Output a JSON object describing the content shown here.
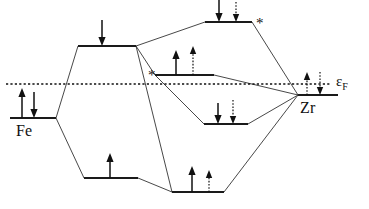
{
  "diagram": {
    "type": "energy-level-correlation",
    "colors": {
      "ink": "#111111",
      "level": "#1a1a1a",
      "correlation": "#333333",
      "background": "#ffffff"
    },
    "fermi": {
      "label_epsilon": "ε",
      "label_subscript": "F",
      "label_full": "εF",
      "y": 84,
      "x_start": 6,
      "x_end": 330,
      "style": "dotted"
    },
    "atoms": [
      {
        "id": "fe",
        "label": "Fe",
        "side": "left"
      },
      {
        "id": "zr",
        "label": "Zr",
        "side": "right"
      }
    ],
    "levels": [
      {
        "id": "fe-atomic",
        "name": "fe-atomic-level",
        "x1": 10,
        "x2": 56,
        "y": 118,
        "electrons": [
          {
            "spin": "up",
            "style": "solid"
          },
          {
            "spin": "down",
            "style": "solid"
          }
        ],
        "star": false
      },
      {
        "id": "top-left-antibonding",
        "name": "upper-left-level",
        "x1": 78,
        "x2": 136,
        "y": 46,
        "electrons": [
          {
            "spin": "down",
            "style": "solid"
          }
        ],
        "star": false
      },
      {
        "id": "top-right-antibonding",
        "name": "upper-right-level",
        "x1": 205,
        "x2": 252,
        "y": 22,
        "electrons": [
          {
            "spin": "down",
            "style": "solid"
          },
          {
            "spin": "down",
            "style": "dotted"
          }
        ],
        "star": true
      },
      {
        "id": "center-level",
        "name": "center-level",
        "x1": 155,
        "x2": 214,
        "y": 75,
        "electrons": [
          {
            "spin": "up",
            "style": "solid"
          },
          {
            "spin": "up",
            "style": "dotted"
          }
        ],
        "star": true
      },
      {
        "id": "mid-right-level",
        "name": "mid-right-level",
        "x1": 204,
        "x2": 248,
        "y": 124,
        "electrons": [
          {
            "spin": "down",
            "style": "solid"
          },
          {
            "spin": "down",
            "style": "dotted"
          }
        ],
        "star": false
      },
      {
        "id": "zr-atomic",
        "name": "zr-atomic-level",
        "x1": 298,
        "x2": 338,
        "y": 95,
        "electrons": [
          {
            "spin": "up",
            "style": "dotted"
          },
          {
            "spin": "down",
            "style": "dotted"
          }
        ],
        "star": false
      },
      {
        "id": "bottom-left-bonding",
        "name": "lower-left-level",
        "x1": 84,
        "x2": 138,
        "y": 178,
        "electrons": [
          {
            "spin": "up",
            "style": "solid"
          }
        ],
        "star": false
      },
      {
        "id": "bottom-right-bonding",
        "name": "lower-right-level",
        "x1": 172,
        "x2": 224,
        "y": 192,
        "electrons": [
          {
            "spin": "up",
            "style": "solid"
          },
          {
            "spin": "up",
            "style": "dotted"
          }
        ],
        "star": false
      }
    ],
    "star_symbol": "*"
  }
}
